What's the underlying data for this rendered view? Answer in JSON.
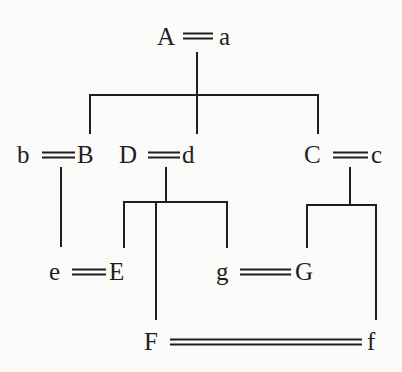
{
  "diagram": {
    "type": "genealogy-marriage-chart",
    "colors": {
      "ink": "#1f1f1f",
      "background": "#fbfbf9"
    },
    "nodes": {
      "A": {
        "label": "A",
        "x": 157,
        "y": 24
      },
      "a": {
        "label": "a",
        "x": 219,
        "y": 24
      },
      "b": {
        "label": "b",
        "x": 17,
        "y": 142
      },
      "B": {
        "label": "B",
        "x": 77,
        "y": 142
      },
      "D": {
        "label": "D",
        "x": 119,
        "y": 142
      },
      "d": {
        "label": "d",
        "x": 182,
        "y": 142
      },
      "C": {
        "label": "C",
        "x": 304,
        "y": 142
      },
      "c": {
        "label": "c",
        "x": 371,
        "y": 142
      },
      "e": {
        "label": "e",
        "x": 49,
        "y": 259
      },
      "E": {
        "label": "E",
        "x": 109,
        "y": 259
      },
      "g": {
        "label": "g",
        "x": 216,
        "y": 259
      },
      "G": {
        "label": "G",
        "x": 295,
        "y": 259
      },
      "F": {
        "label": "F",
        "x": 144,
        "y": 329
      },
      "f": {
        "label": "f",
        "x": 367,
        "y": 329
      }
    },
    "marriages": [
      {
        "between": [
          "A",
          "a"
        ],
        "x1": 183,
        "x2": 213,
        "y": 36
      },
      {
        "between": [
          "b",
          "B"
        ],
        "x1": 42,
        "x2": 75,
        "y": 155
      },
      {
        "between": [
          "D",
          "d"
        ],
        "x1": 148,
        "x2": 180,
        "y": 155
      },
      {
        "between": [
          "C",
          "c"
        ],
        "x1": 333,
        "x2": 368,
        "y": 155
      },
      {
        "between": [
          "e",
          "E"
        ],
        "x1": 72,
        "x2": 106,
        "y": 272
      },
      {
        "between": [
          "g",
          "G"
        ],
        "x1": 240,
        "x2": 291,
        "y": 272
      },
      {
        "between": [
          "F",
          "f"
        ],
        "x1": 170,
        "x2": 362,
        "y": 342
      }
    ],
    "descent_lines": [
      {
        "from": "A=a",
        "to": [
          "B",
          "d",
          "C"
        ]
      },
      {
        "from": "b=B",
        "to": [
          "e"
        ]
      },
      {
        "from": "D=d",
        "to": [
          "E",
          "F",
          "g"
        ]
      },
      {
        "from": "C=c",
        "to": [
          "G",
          "f"
        ]
      }
    ]
  }
}
